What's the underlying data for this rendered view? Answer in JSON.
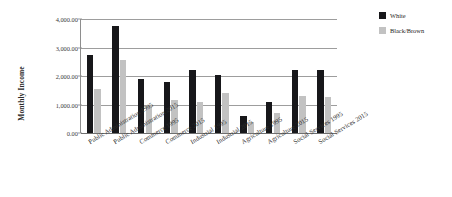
{
  "chart_data": {
    "type": "bar",
    "title": "",
    "xlabel": "",
    "ylabel": "Monthly Income",
    "ylim": [
      0,
      4000
    ],
    "ytick_labels": [
      "0.00",
      "1,000.00",
      "2,000.00",
      "3,000.00",
      "4,000.00"
    ],
    "ytick_values": [
      0,
      1000,
      2000,
      3000,
      4000
    ],
    "grid": true,
    "legend_position": "right",
    "categories": [
      "Public Administration 1995",
      "Public Administration 2015",
      "Commerce 1995",
      "Commerce  2015",
      "Industrial 1995",
      "Industrial 2015",
      "Agriculture 1995",
      "Agriculture 2015",
      "Social Services 1995",
      "Social Services 2015"
    ],
    "series": [
      {
        "name": "White",
        "color": "#17171a",
        "values": [
          2750,
          3750,
          1900,
          1800,
          2200,
          2050,
          600,
          1100,
          2200,
          2200
        ]
      },
      {
        "name": "Black/Brown",
        "color": "#c2c2c2",
        "values": [
          1550,
          2550,
          1000,
          1150,
          1100,
          1400,
          380,
          700,
          1300,
          1250
        ]
      }
    ]
  },
  "legend": {
    "items": [
      {
        "label": "White",
        "color": "#17171a"
      },
      {
        "label": "Black/Brown",
        "color": "#c2c2c2"
      }
    ]
  },
  "axis": {
    "y_title": "Monthly Income"
  }
}
